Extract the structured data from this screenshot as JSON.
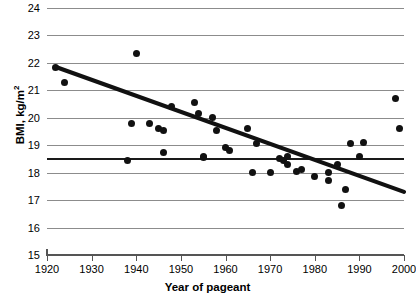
{
  "chart_data": {
    "type": "scatter",
    "title": "",
    "xlabel": "Year of pageant",
    "ylabel": "BMI, kg/m",
    "ylabel_sup": "2",
    "xlim": [
      1920,
      2000
    ],
    "ylim": [
      15,
      24
    ],
    "xticks": [
      1920,
      1930,
      1940,
      1950,
      1960,
      1970,
      1980,
      1990,
      2000
    ],
    "yticks": [
      15,
      16,
      17,
      18,
      19,
      20,
      21,
      22,
      23,
      24
    ],
    "grid": "horizontal",
    "legend": "none",
    "x": [
      1922,
      1924,
      1938,
      1939,
      1940,
      1943,
      1945,
      1946,
      1946,
      1948,
      1953,
      1954,
      1955,
      1955,
      1957,
      1958,
      1960,
      1961,
      1965,
      1966,
      1967,
      1970,
      1972,
      1973,
      1974,
      1974,
      1976,
      1977,
      1980,
      1983,
      1983,
      1985,
      1986,
      1987,
      1988,
      1990,
      1991,
      1998,
      1999
    ],
    "y": [
      21.85,
      21.3,
      18.45,
      19.8,
      22.35,
      19.78,
      19.6,
      19.55,
      18.75,
      20.4,
      20.55,
      20.15,
      18.55,
      18.6,
      20.0,
      19.55,
      18.9,
      18.8,
      19.6,
      18.0,
      19.05,
      18.0,
      18.5,
      18.45,
      18.6,
      18.3,
      18.05,
      18.1,
      17.85,
      18.0,
      17.7,
      18.3,
      16.8,
      17.4,
      19.05,
      18.6,
      19.1,
      20.7,
      19.6
    ],
    "marker": "filled-circle",
    "marker_color": "#111111",
    "trendline": {
      "type": "linear-fit",
      "x_start": 1922,
      "y_start": 21.85,
      "x_end": 2000,
      "y_end": 17.3,
      "color": "#111111"
    },
    "reference_line": {
      "type": "horizontal",
      "y": 18.55,
      "color": "#1a1a1a",
      "label": ""
    }
  }
}
